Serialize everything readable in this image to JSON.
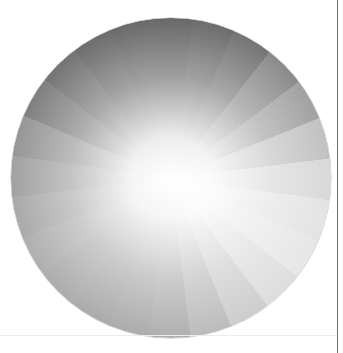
{
  "color_wheel": {
    "mode": "grayscale",
    "segments": 24,
    "segment_grays": [
      "#2a2a2a",
      "#303030",
      "#3a3a3a",
      "#5a5a5a",
      "#7a7a7a",
      "#a8a8a8",
      "#c8c8c8",
      "#d8d8d8",
      "#dcdcdc",
      "#cfcfcf",
      "#b8b8b8",
      "#a0a0a0",
      "#8e8e8e",
      "#8a8a8a",
      "#888888",
      "#8a8a8a",
      "#8e8e8e",
      "#868686",
      "#7a7a7a",
      "#6a6a6a",
      "#4a4a4a",
      "#3a3a3a",
      "#303030",
      "#2c2c2c"
    ],
    "center_color": "#ffffff"
  },
  "divider_color": "#6e6e6e"
}
